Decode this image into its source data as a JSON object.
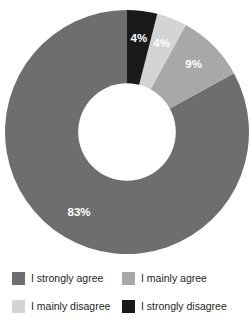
{
  "chart_data": {
    "type": "pie",
    "variant": "donut",
    "title": "",
    "subtitle": "",
    "xlabel": "",
    "ylabel": "",
    "grid": false,
    "legend_position": "bottom",
    "legend_columns": 2,
    "units": "percent",
    "total": 100,
    "start_angle_deg": 0,
    "direction": "counterclockwise",
    "inner_radius_ratio": 0.4,
    "categories": [
      "I strongly agree",
      "I mainly agree",
      "I mainly disagree",
      "I strongly disagree"
    ],
    "values": [
      83,
      9,
      4,
      4
    ],
    "data_labels": [
      "83%",
      "9%",
      "4%",
      "4%"
    ],
    "colors": [
      "#6e6e6e",
      "#a8a8a8",
      "#d4d4d4",
      "#1a1a1a"
    ],
    "slices": [
      {
        "label": "I strongly agree",
        "value": 83,
        "data_label": "83%",
        "color": "#6e6e6e",
        "label_color": "#ffffff"
      },
      {
        "label": "I mainly agree",
        "value": 9,
        "data_label": "9%",
        "color": "#a8a8a8",
        "label_color": "#ffffff"
      },
      {
        "label": "I mainly disagree",
        "value": 4,
        "data_label": "4%",
        "color": "#d4d4d4",
        "label_color": "#ffffff"
      },
      {
        "label": "I strongly disagree",
        "value": 4,
        "data_label": "4%",
        "color": "#1a1a1a",
        "label_color": "#ffffff"
      }
    ]
  },
  "labels": {
    "strongly_agree_pct": "83%",
    "mainly_agree_pct": "9%",
    "mainly_disagree_pct": "4%",
    "strongly_disagree_pct": "4%"
  },
  "legend": {
    "items": [
      {
        "label": "I strongly agree",
        "color": "#6e6e6e"
      },
      {
        "label": "I mainly agree",
        "color": "#a8a8a8"
      },
      {
        "label": "I mainly disagree",
        "color": "#d4d4d4"
      },
      {
        "label": "I strongly disagree",
        "color": "#1a1a1a"
      }
    ]
  },
  "colors": {
    "background": "#ffffff",
    "hole": "#ffffff",
    "text": "#231f20",
    "data_label": "#ffffff"
  }
}
